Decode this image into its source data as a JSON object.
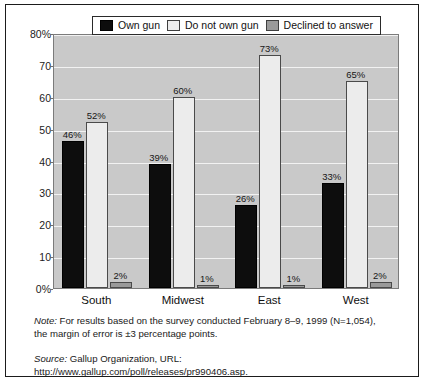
{
  "chart_data": {
    "type": "bar",
    "title": "",
    "xlabel": "",
    "ylabel": "",
    "categories": [
      "South",
      "Midwest",
      "East",
      "West"
    ],
    "series": [
      {
        "name": "Own gun",
        "color": "#0d0d0d",
        "values": [
          46,
          39,
          26,
          33
        ],
        "labels": [
          "46%",
          "39%",
          "26%",
          "33%"
        ]
      },
      {
        "name": "Do not own gun",
        "color": "#ececec",
        "values": [
          52,
          60,
          73,
          65
        ],
        "labels": [
          "52%",
          "60%",
          "73%",
          "65%"
        ]
      },
      {
        "name": "Declined to answer",
        "color": "#9a9a9a",
        "values": [
          2,
          1,
          1,
          2
        ],
        "labels": [
          "2%",
          "1%",
          "1%",
          "2%"
        ]
      }
    ],
    "ylim": [
      0,
      80
    ],
    "ytick_values": [
      0,
      10,
      20,
      30,
      40,
      50,
      60,
      70,
      80
    ],
    "ytick_labels": [
      "0%",
      "10",
      "20",
      "30",
      "40",
      "50",
      "60",
      "70",
      "80%"
    ],
    "grid": true,
    "legend_position": "top-center",
    "plot_background": "#c9c9c9",
    "gridline_color": "#f2f2f2"
  },
  "legend": {
    "items": [
      {
        "label": "Own gun",
        "swatch": "own"
      },
      {
        "label": "Do not own gun",
        "swatch": "donot"
      },
      {
        "label": "Declined to answer",
        "swatch": "decl"
      }
    ]
  },
  "footnotes": {
    "note_label": "Note:",
    "note_text": " For results based on the survey conducted February 8–9, 1999 (N=1,054), the margin of error is ±3 percentage points.",
    "source_label": "Source:",
    "source_text": " Gallup Organization, URL: http://www.gallup.com/poll/releases/pr990406.asp."
  }
}
